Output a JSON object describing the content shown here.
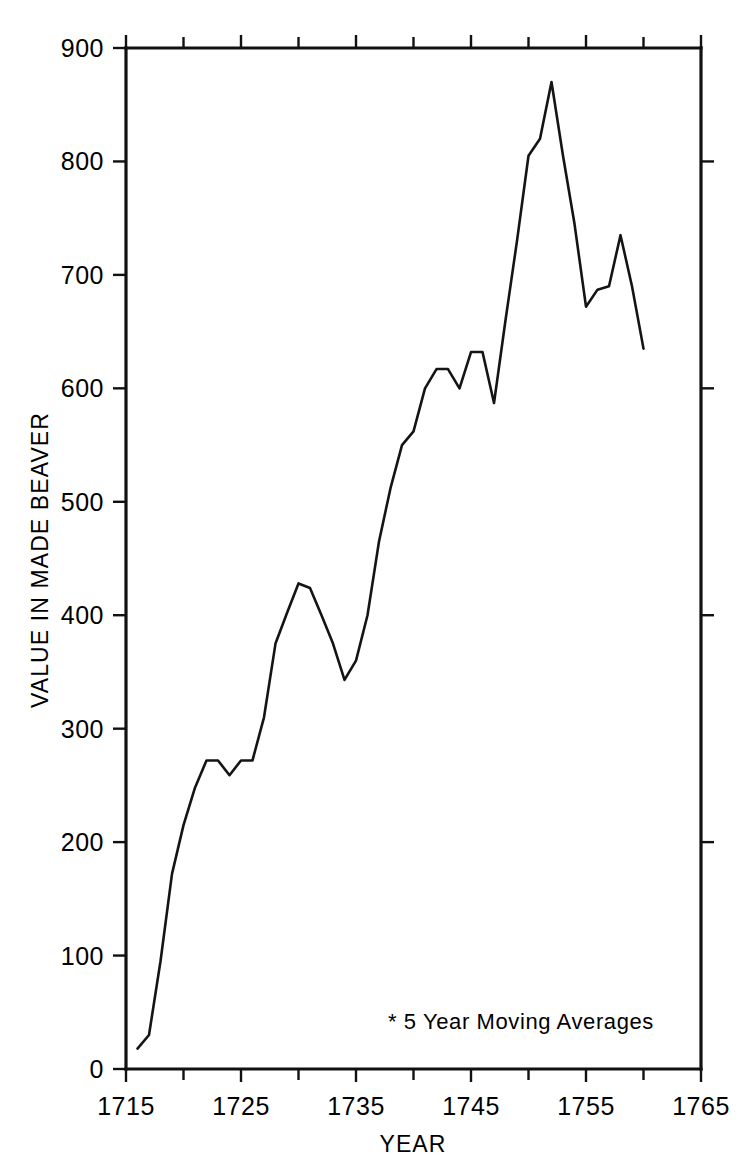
{
  "chart_data": {
    "type": "line",
    "title": "",
    "subtitle": "",
    "xlabel": "YEAR",
    "ylabel": "VALUE IN MADE BEAVER",
    "xlim": [
      1715,
      1765
    ],
    "ylim": [
      0,
      900
    ],
    "grid": false,
    "legend": null,
    "annotations": [
      {
        "name": "moving-average-note",
        "text": "* 5 Year Moving Averages",
        "x": 1743.5,
        "y": 58
      }
    ],
    "x_tick_labels": [
      "1715",
      "1725",
      "1735",
      "1745",
      "1755",
      "1765"
    ],
    "x_tick_values": [
      1715,
      1725,
      1735,
      1745,
      1755,
      1765
    ],
    "x_minor_tick_values": [
      1720,
      1730,
      1740,
      1750,
      1760
    ],
    "y_tick_labels": [
      "0",
      "100",
      "200",
      "300",
      "400",
      "500",
      "600",
      "700",
      "800",
      "900"
    ],
    "y_tick_values": [
      0,
      100,
      200,
      300,
      400,
      500,
      600,
      700,
      800,
      900
    ],
    "series": [
      {
        "name": "Value in Made Beaver",
        "color": "#141414",
        "x": [
          1716,
          1717,
          1718,
          1719,
          1720,
          1721,
          1722,
          1723,
          1724,
          1725,
          1726,
          1727,
          1728,
          1729,
          1730,
          1731,
          1732,
          1733,
          1734,
          1735,
          1736,
          1737,
          1738,
          1739,
          1740,
          1741,
          1742,
          1743,
          1744,
          1745,
          1746,
          1747,
          1748,
          1749,
          1750,
          1751,
          1752,
          1753,
          1754,
          1755,
          1756,
          1757,
          1758,
          1759,
          1760
        ],
        "y": [
          18,
          30,
          95,
          172,
          215,
          248,
          272,
          272,
          259,
          272,
          272,
          310,
          375,
          402,
          428,
          424,
          400,
          375,
          343,
          360,
          400,
          465,
          512,
          550,
          562,
          600,
          617,
          617,
          600,
          632,
          632,
          587,
          660,
          730,
          805,
          820,
          870,
          805,
          745,
          672,
          687,
          690,
          735,
          690,
          635
        ]
      }
    ]
  },
  "axes": {
    "y_axis_title": "VALUE IN MADE BEAVER",
    "x_axis_title": "YEAR"
  },
  "footnote": {
    "text": "* 5 Year Moving Averages"
  }
}
